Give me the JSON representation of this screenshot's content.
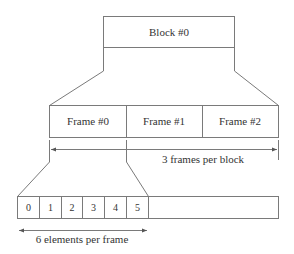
{
  "block": {
    "label": "Block #0"
  },
  "frames": [
    {
      "label": "Frame #0"
    },
    {
      "label": "Frame #1"
    },
    {
      "label": "Frame #2"
    }
  ],
  "elements": [
    "0",
    "1",
    "2",
    "3",
    "4",
    "5"
  ],
  "annotations": {
    "frames_per_block": "3 frames per block",
    "elements_per_frame": "6 elements per frame"
  }
}
